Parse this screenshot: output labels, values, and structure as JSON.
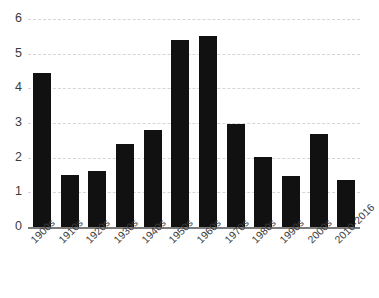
{
  "chart_data": {
    "type": "bar",
    "title": "",
    "subtitle": "",
    "xlabel": "",
    "ylabel": "",
    "categories": [
      "1900s",
      "1910s",
      "1920s",
      "1930s",
      "1940s",
      "1950s",
      "1960s",
      "1970s",
      "1980s",
      "1990s",
      "2000s",
      "2010-2016"
    ],
    "values": [
      4.45,
      1.5,
      1.63,
      2.4,
      2.8,
      5.4,
      5.52,
      2.96,
      2.02,
      1.46,
      2.68,
      1.37
    ],
    "ylim": [
      0,
      6
    ],
    "yticks": [
      0,
      1,
      2,
      3,
      4,
      5,
      6
    ],
    "ytick_labels": [
      "0",
      "1",
      "2",
      "3",
      "4",
      "5",
      "6"
    ],
    "grid": true,
    "grid_axis": "y",
    "grid_style": "dashed",
    "legend": false,
    "legend_position": "none",
    "bar_color": "#111111",
    "grid_color": "#d6d6d6",
    "axis_color": "#7b7b7b",
    "tick_label_color": "#3c3c3c",
    "background_color": "#ffffff",
    "xtick_rotation": -45
  }
}
